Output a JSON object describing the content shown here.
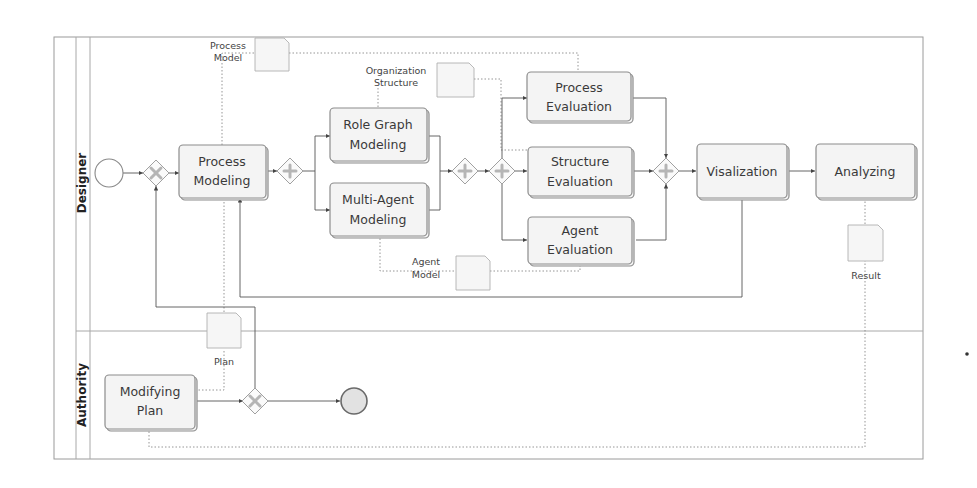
{
  "pool": {
    "lanes": [
      {
        "label": "Designer"
      },
      {
        "label": "Authority"
      }
    ]
  },
  "tasks": {
    "process_modeling": [
      "Process",
      "Modeling"
    ],
    "role_graph_modeling": [
      "Role Graph",
      "Modeling"
    ],
    "multi_agent_modeling": [
      "Multi-Agent",
      "Modeling"
    ],
    "process_evaluation": [
      "Process",
      "Evaluation"
    ],
    "structure_evaluation": [
      "Structure",
      "Evaluation"
    ],
    "agent_evaluation": [
      "Agent",
      "Evaluation"
    ],
    "visualization": [
      "Visalization"
    ],
    "analyzing": [
      "Analyzing"
    ],
    "modifying_plan": [
      "Modifying",
      "Plan"
    ]
  },
  "data_objects": {
    "process_model": [
      "Process",
      "Model"
    ],
    "organization_structure": [
      "Organization",
      "Structure"
    ],
    "agent_model": [
      "Agent",
      "Model"
    ],
    "result": [
      "Result"
    ],
    "plan": [
      "Plan"
    ]
  },
  "gateways": {
    "exclusive_symbol": "x",
    "parallel_symbol": "+"
  },
  "colors": {
    "task_fill": "#f4f4f4",
    "task_stroke": "#8c8c8c",
    "flow": "#555555",
    "association": "#8a8a8a",
    "end_event_fill": "#e2e2e2"
  }
}
